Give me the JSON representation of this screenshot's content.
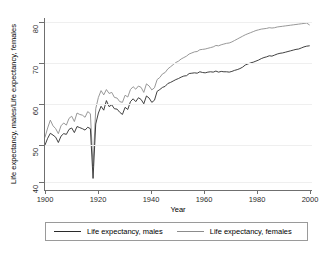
{
  "chart_data": {
    "type": "line",
    "title": "",
    "xlabel": "Year",
    "ylabel": "Life expectancy, males/Life expectancy, females",
    "xlim": [
      1900,
      2000
    ],
    "ylim": [
      36,
      81
    ],
    "xticks": [
      1900,
      1920,
      1940,
      1960,
      1980,
      2000
    ],
    "yticks": [
      40,
      50,
      60,
      70,
      80
    ],
    "grid": "horizontal",
    "legend_position": "bottom",
    "x": [
      1900,
      1901,
      1902,
      1903,
      1904,
      1905,
      1906,
      1907,
      1908,
      1909,
      1910,
      1911,
      1912,
      1913,
      1914,
      1915,
      1916,
      1917,
      1918,
      1919,
      1920,
      1921,
      1922,
      1923,
      1924,
      1925,
      1926,
      1927,
      1928,
      1929,
      1930,
      1931,
      1932,
      1933,
      1934,
      1935,
      1936,
      1937,
      1938,
      1939,
      1940,
      1941,
      1942,
      1943,
      1944,
      1945,
      1946,
      1947,
      1948,
      1949,
      1950,
      1951,
      1952,
      1953,
      1954,
      1955,
      1956,
      1957,
      1958,
      1959,
      1960,
      1961,
      1962,
      1963,
      1964,
      1965,
      1966,
      1967,
      1968,
      1969,
      1970,
      1971,
      1972,
      1973,
      1974,
      1975,
      1976,
      1977,
      1978,
      1979,
      1980,
      1981,
      1982,
      1983,
      1984,
      1985,
      1986,
      1987,
      1988,
      1989,
      1990,
      1991,
      1992,
      1993,
      1994,
      1995,
      1996,
      1997,
      1998,
      1999
    ],
    "series": [
      {
        "name": "Life expectancy, males",
        "color": "#2b2b2b",
        "values": [
          46.4,
          48.3,
          49.7,
          49.2,
          48.6,
          47.1,
          48.9,
          49.6,
          49.4,
          50.8,
          51.2,
          49.9,
          51.6,
          51.3,
          51.0,
          50.6,
          51.4,
          51.0,
          37.0,
          52.3,
          55.4,
          57.3,
          56.2,
          58.9,
          57.2,
          57.7,
          56.6,
          56.5,
          55.6,
          55.0,
          57.0,
          56.4,
          58.6,
          59.4,
          58.6,
          59.7,
          59.2,
          58.0,
          60.2,
          59.6,
          58.4,
          59.0,
          61.5,
          62.0,
          62.6,
          62.9,
          63.7,
          64.0,
          64.4,
          64.8,
          65.1,
          65.5,
          65.8,
          65.9,
          66.5,
          66.6,
          66.7,
          66.6,
          67.0,
          66.8,
          66.7,
          66.9,
          67.0,
          66.9,
          67.2,
          66.9,
          67.1,
          67.0,
          67.0,
          66.9,
          67.1,
          67.4,
          67.6,
          67.9,
          68.3,
          68.9,
          69.2,
          69.5,
          69.7,
          70.0,
          70.3,
          70.7,
          71.0,
          71.2,
          71.5,
          71.4,
          71.7,
          72.0,
          72.2,
          72.3,
          72.5,
          72.7,
          72.9,
          73.1,
          73.3,
          73.4,
          73.7,
          74.0,
          74.2,
          74.3
        ]
      },
      {
        "name": "Life expectancy, females",
        "color": "#8c8c8c",
        "values": [
          48.6,
          51.2,
          53.4,
          51.8,
          51.0,
          49.6,
          51.8,
          52.6,
          52.0,
          53.9,
          54.5,
          53.0,
          55.4,
          55.0,
          54.8,
          54.2,
          55.8,
          55.2,
          40.5,
          56.6,
          59.8,
          61.7,
          60.5,
          62.0,
          60.9,
          61.2,
          59.8,
          59.6,
          58.6,
          58.4,
          60.4,
          59.9,
          62.0,
          62.8,
          62.1,
          63.0,
          62.6,
          61.2,
          63.6,
          63.0,
          61.9,
          62.5,
          64.8,
          65.4,
          66.4,
          66.8,
          67.8,
          68.4,
          69.0,
          69.6,
          70.0,
          70.6,
          71.0,
          71.4,
          72.0,
          72.3,
          72.6,
          72.7,
          73.2,
          73.3,
          73.4,
          73.6,
          73.8,
          74.0,
          74.4,
          74.3,
          74.6,
          74.8,
          75.0,
          75.1,
          75.4,
          75.8,
          76.2,
          76.6,
          77.0,
          77.4,
          77.7,
          78.0,
          78.3,
          78.6,
          78.8,
          79.0,
          79.1,
          79.2,
          79.4,
          79.3,
          79.4,
          79.6,
          79.7,
          79.8,
          79.9,
          80.0,
          80.1,
          80.2,
          80.3,
          80.4,
          80.5,
          80.6,
          80.7,
          80.2
        ]
      }
    ]
  },
  "axes": {
    "x_title": "Year",
    "y_title": "Life expectancy, males/Life expectancy, females",
    "x_tick_labels": [
      "1900",
      "1920",
      "1940",
      "1960",
      "1980",
      "2000"
    ],
    "y_tick_labels": [
      "40",
      "50",
      "60",
      "70",
      "80"
    ]
  },
  "legend": {
    "entries": [
      {
        "label": "Life expectancy, males",
        "color": "#2b2b2b"
      },
      {
        "label": "Life expectancy, females",
        "color": "#8c8c8c"
      }
    ]
  }
}
